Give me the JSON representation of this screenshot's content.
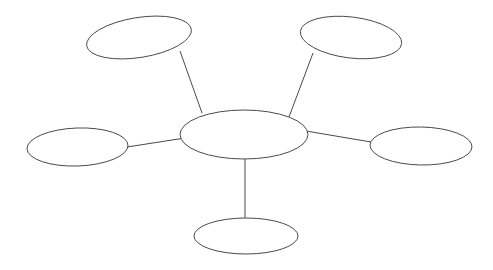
{
  "document": {
    "title": "Concept Map Diagram",
    "type": "blank-spider-map",
    "background_color": "#ffffff",
    "stroke_color": "#4a4a4a",
    "fill_color": "#ffffff",
    "stroke_width": 1,
    "width": 493,
    "height": 270
  },
  "diagram": {
    "center_node": {
      "id": "center-node",
      "label": "",
      "cx": 244,
      "cy": 134.5,
      "rx": 64,
      "ry": 24.5,
      "rotation": 0
    },
    "branch_nodes": [
      {
        "id": "node-top-left",
        "label": "",
        "cx": 139,
        "cy": 37.5,
        "rx": 53,
        "ry": 20,
        "rotation": -9
      },
      {
        "id": "node-top-right",
        "label": "",
        "cx": 351,
        "cy": 37.5,
        "rx": 51,
        "ry": 20.5,
        "rotation": 7
      },
      {
        "id": "node-left",
        "label": "",
        "cx": 77.5,
        "cy": 147,
        "rx": 50.5,
        "ry": 19,
        "rotation": -2
      },
      {
        "id": "node-right",
        "label": "",
        "cx": 421,
        "cy": 146,
        "rx": 51,
        "ry": 19,
        "rotation": 1
      },
      {
        "id": "node-bottom",
        "label": "",
        "cx": 246,
        "cy": 236,
        "rx": 52,
        "ry": 18,
        "rotation": 0
      }
    ],
    "connectors": [
      {
        "id": "connector-top-left",
        "x1": 180,
        "y1": 51,
        "x2": 202,
        "y2": 113
      },
      {
        "id": "connector-top-right",
        "x1": 313,
        "y1": 53,
        "x2": 289,
        "y2": 117
      },
      {
        "id": "connector-left",
        "x1": 127,
        "y1": 147,
        "x2": 185,
        "y2": 138
      },
      {
        "id": "connector-right",
        "x1": 306,
        "y1": 131,
        "x2": 371,
        "y2": 142
      },
      {
        "id": "connector-bottom",
        "x1": 245,
        "y1": 158,
        "x2": 245,
        "y2": 220
      }
    ]
  }
}
